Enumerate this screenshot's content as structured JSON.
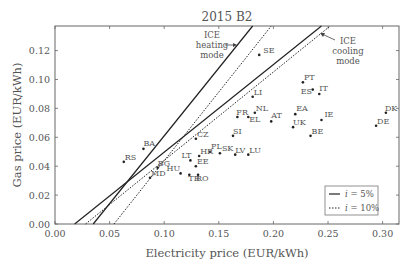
{
  "chart_data": {
    "type": "scatter",
    "title": "2015 B2",
    "xlabel": "Electricity price (EUR/kWh)",
    "ylabel": "Gas price (EUR/kWh)",
    "xlim": [
      0.0,
      0.315
    ],
    "ylim": [
      0.0,
      0.137
    ],
    "xticks": [
      "0.00",
      "0.05",
      "0.10",
      "0.15",
      "0.20",
      "0.25",
      "0.30"
    ],
    "xtick_values": [
      0.0,
      0.05,
      0.1,
      0.15,
      0.2,
      0.25,
      0.3
    ],
    "yticks": [
      "0.00",
      "0.02",
      "0.04",
      "0.06",
      "0.08",
      "0.10",
      "0.12"
    ],
    "ytick_values": [
      0.0,
      0.02,
      0.04,
      0.06,
      0.08,
      0.1,
      0.12
    ],
    "grid": false,
    "points": [
      {
        "label": "SE",
        "x": 0.187,
        "y": 0.117,
        "lx": 4,
        "ly": -2
      },
      {
        "label": "LI",
        "x": 0.181,
        "y": 0.088,
        "lx": 1,
        "ly": -2
      },
      {
        "label": "PT",
        "x": 0.227,
        "y": 0.098,
        "lx": 1,
        "ly": -2
      },
      {
        "label": "ES",
        "x": 0.236,
        "y": 0.093,
        "lx": -12,
        "ly": 4
      },
      {
        "label": "IT",
        "x": 0.242,
        "y": 0.09,
        "lx": 0,
        "ly": -3
      },
      {
        "label": "FR",
        "x": 0.167,
        "y": 0.074,
        "lx": -1,
        "ly": -2
      },
      {
        "label": "NL",
        "x": 0.183,
        "y": 0.077,
        "lx": 1,
        "ly": -2
      },
      {
        "label": "EL",
        "x": 0.177,
        "y": 0.074,
        "lx": 1,
        "ly": 5
      },
      {
        "label": "AT",
        "x": 0.198,
        "y": 0.071,
        "lx": 0,
        "ly": -3
      },
      {
        "label": "EA",
        "x": 0.22,
        "y": 0.076,
        "lx": 1,
        "ly": -3
      },
      {
        "label": "UK",
        "x": 0.218,
        "y": 0.067,
        "lx": 0,
        "ly": -2
      },
      {
        "label": "IE",
        "x": 0.244,
        "y": 0.072,
        "lx": 3,
        "ly": -3
      },
      {
        "label": "BE",
        "x": 0.234,
        "y": 0.061,
        "lx": 1,
        "ly": -2
      },
      {
        "label": "DK",
        "x": 0.303,
        "y": 0.077,
        "lx": -1,
        "ly": -2
      },
      {
        "label": "DE",
        "x": 0.294,
        "y": 0.068,
        "lx": 1,
        "ly": -2
      },
      {
        "label": "SI",
        "x": 0.163,
        "y": 0.061,
        "lx": 0,
        "ly": -2
      },
      {
        "label": "CZ",
        "x": 0.129,
        "y": 0.059,
        "lx": 1,
        "ly": -2
      },
      {
        "label": "BA",
        "x": 0.081,
        "y": 0.052,
        "lx": 0,
        "ly": -3
      },
      {
        "label": "PL",
        "x": 0.142,
        "y": 0.05,
        "lx": 1,
        "ly": -3
      },
      {
        "label": "SK",
        "x": 0.151,
        "y": 0.049,
        "lx": 2,
        "ly": -2
      },
      {
        "label": "LV",
        "x": 0.165,
        "y": 0.048,
        "lx": 0,
        "ly": -2
      },
      {
        "label": "LU",
        "x": 0.177,
        "y": 0.048,
        "lx": 1,
        "ly": -2
      },
      {
        "label": "HR",
        "x": 0.132,
        "y": 0.047,
        "lx": 1,
        "ly": -2
      },
      {
        "label": "LT",
        "x": 0.124,
        "y": 0.044,
        "lx": -9,
        "ly": -2
      },
      {
        "label": "EE",
        "x": 0.129,
        "y": 0.04,
        "lx": 1,
        "ly": -2
      },
      {
        "label": "BG",
        "x": 0.094,
        "y": 0.039,
        "lx": 0,
        "ly": -2
      },
      {
        "label": "RS",
        "x": 0.063,
        "y": 0.043,
        "lx": 1,
        "ly": -2
      },
      {
        "label": "HU",
        "x": 0.115,
        "y": 0.035,
        "lx": -14,
        "ly": -2
      },
      {
        "label": "TR",
        "x": 0.123,
        "y": 0.034,
        "lx": -1,
        "ly": 6
      },
      {
        "label": "RO",
        "x": 0.131,
        "y": 0.034,
        "lx": -2,
        "ly": 6
      },
      {
        "label": "MD",
        "x": 0.087,
        "y": 0.032,
        "lx": 1,
        "ly": -2
      }
    ],
    "series": [
      {
        "name": "ICE heating mode, i = 5%",
        "style": "solid",
        "x": [
          0.035,
          0.181
        ],
        "y": [
          0.0,
          0.137
        ]
      },
      {
        "name": "ICE heating mode, i = 10%",
        "style": "dotted",
        "x": [
          0.054,
          0.198
        ],
        "y": [
          0.0,
          0.137
        ]
      },
      {
        "name": "ICE cooling mode, i = 5%",
        "style": "solid",
        "x": [
          0.018,
          0.244
        ],
        "y": [
          0.0,
          0.137
        ]
      },
      {
        "name": "ICE cooling mode, i = 10%",
        "style": "dotted",
        "x": [
          0.028,
          0.252
        ],
        "y": [
          0.0,
          0.137
        ]
      }
    ],
    "annotations": [
      {
        "text": [
          "ICE",
          "heating",
          "mode"
        ],
        "target": "heating lines"
      },
      {
        "text": [
          "ICE",
          "cooling",
          "mode"
        ],
        "target": "cooling lines"
      }
    ],
    "legend": {
      "position": "lower right",
      "entries": [
        {
          "label": "i = 5%",
          "style": "solid"
        },
        {
          "label": "i = 10%",
          "style": "dotted"
        }
      ]
    }
  },
  "labels": {
    "title": "2015 B2",
    "xlabel": "Electricity price (EUR/kWh)",
    "ylabel": "Gas price (EUR/kWh)",
    "heating_1": "ICE",
    "heating_2": "heating",
    "heating_3": "mode",
    "cooling_1": "ICE",
    "cooling_2": "cooling",
    "cooling_3": "mode",
    "legend_solid_var": "i",
    "legend_solid_rest": " = 5%",
    "legend_dotted_var": "i",
    "legend_dotted_rest": " = 10%"
  }
}
